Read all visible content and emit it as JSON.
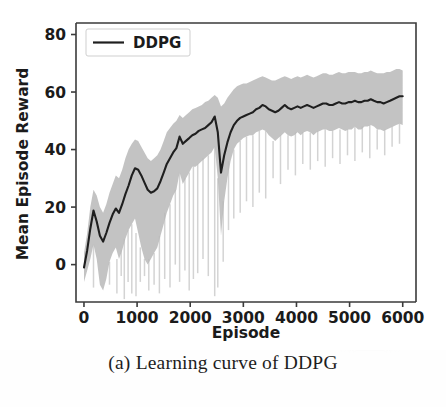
{
  "figure": {
    "caption": "(a) Learning curve of DDPG"
  },
  "chart_data": {
    "type": "line",
    "title": "",
    "subtitle": "",
    "xlabel": "Episode",
    "ylabel": "Mean Episode Reward",
    "xlim": [
      -150,
      6250
    ],
    "ylim": [
      -13,
      84
    ],
    "xticks": [
      0,
      1000,
      2000,
      3000,
      4000,
      5000,
      6000
    ],
    "xtick_labels": [
      "0",
      "1000",
      "2000",
      "3000",
      "4000",
      "5000",
      "6000"
    ],
    "yticks": [
      0,
      20,
      40,
      60,
      80
    ],
    "ytick_labels": [
      "0",
      "20",
      "40",
      "60",
      "80"
    ],
    "grid": false,
    "legend": {
      "position": "upper-left",
      "entries": [
        {
          "label": "DDPG",
          "color": "#1f1f1f",
          "style": "solid"
        }
      ]
    },
    "colors": {
      "line": "#1f1f1f",
      "band": "#b9b9b9",
      "axis": "#3b3b3b",
      "background": "#ffffff"
    },
    "series": [
      {
        "name": "DDPG",
        "kind": "mean-with-band",
        "x": [
          0,
          60,
          120,
          180,
          240,
          300,
          360,
          420,
          480,
          540,
          600,
          660,
          720,
          780,
          840,
          900,
          960,
          1020,
          1080,
          1140,
          1200,
          1260,
          1320,
          1380,
          1440,
          1500,
          1560,
          1620,
          1680,
          1740,
          1800,
          1860,
          1920,
          1980,
          2040,
          2100,
          2160,
          2220,
          2280,
          2340,
          2400,
          2460,
          2520,
          2580,
          2640,
          2700,
          2760,
          2820,
          2880,
          2940,
          3000,
          3060,
          3120,
          3180,
          3240,
          3300,
          3360,
          3420,
          3480,
          3540,
          3600,
          3660,
          3720,
          3780,
          3840,
          3900,
          3960,
          4020,
          4080,
          4140,
          4200,
          4260,
          4320,
          4380,
          4440,
          4500,
          4560,
          4620,
          4680,
          4740,
          4800,
          4860,
          4920,
          4980,
          5040,
          5100,
          5160,
          5220,
          5280,
          5340,
          5400,
          5460,
          5520,
          5580,
          5640,
          5700,
          5760,
          5820,
          5880,
          5940,
          6000
        ],
        "mean": [
          -1.0,
          5.0,
          12.5,
          18.8,
          15.0,
          10.0,
          8.0,
          11.0,
          14.5,
          17.5,
          19.5,
          18.0,
          21.0,
          24.5,
          27.5,
          31.0,
          33.5,
          33.0,
          31.0,
          28.5,
          26.0,
          25.0,
          25.5,
          26.5,
          29.0,
          32.0,
          35.0,
          37.0,
          39.0,
          40.5,
          44.5,
          42.0,
          43.0,
          44.0,
          45.0,
          45.5,
          46.5,
          47.0,
          47.5,
          48.5,
          49.5,
          51.5,
          46.0,
          32.0,
          38.0,
          42.5,
          46.0,
          48.5,
          50.0,
          51.0,
          51.5,
          52.0,
          52.5,
          53.0,
          54.0,
          54.5,
          55.5,
          55.0,
          54.0,
          53.5,
          53.0,
          53.5,
          54.5,
          55.5,
          54.5,
          54.0,
          54.5,
          55.0,
          54.5,
          55.0,
          55.5,
          55.0,
          54.5,
          55.0,
          55.5,
          56.0,
          56.0,
          55.5,
          55.5,
          56.0,
          56.5,
          56.0,
          56.0,
          56.5,
          56.5,
          57.0,
          56.5,
          56.5,
          57.0,
          57.0,
          57.5,
          57.0,
          56.5,
          56.5,
          56.0,
          56.5,
          57.0,
          57.5,
          58.0,
          58.5,
          58.5
        ],
        "band_upper": [
          4.0,
          11.0,
          20.0,
          26.0,
          24.0,
          20.0,
          18.0,
          21.0,
          25.0,
          28.0,
          31.0,
          30.0,
          33.0,
          37.0,
          40.0,
          42.0,
          43.5,
          43.0,
          41.0,
          39.0,
          37.0,
          36.0,
          37.0,
          38.0,
          40.0,
          43.0,
          46.0,
          47.5,
          49.0,
          50.0,
          52.0,
          51.0,
          52.0,
          53.0,
          54.0,
          54.5,
          55.0,
          55.5,
          56.5,
          57.0,
          58.0,
          59.0,
          58.0,
          55.0,
          56.0,
          58.0,
          59.5,
          61.0,
          62.0,
          62.5,
          63.0,
          63.0,
          63.5,
          64.0,
          64.5,
          65.0,
          65.5,
          65.0,
          64.5,
          64.0,
          64.0,
          64.5,
          65.0,
          65.5,
          65.0,
          64.5,
          65.0,
          65.5,
          65.0,
          65.5,
          66.0,
          65.5,
          65.0,
          65.5,
          66.0,
          66.5,
          66.5,
          66.0,
          66.0,
          66.5,
          67.0,
          66.5,
          66.5,
          67.0,
          67.0,
          67.0,
          66.5,
          66.5,
          67.0,
          67.0,
          67.5,
          67.0,
          66.5,
          66.5,
          66.5,
          67.0,
          67.0,
          67.5,
          68.0,
          68.0,
          67.5
        ],
        "band_lower": [
          -6.0,
          -2.0,
          2.0,
          7.0,
          2.0,
          -7.0,
          -9.0,
          -5.0,
          1.0,
          4.0,
          6.0,
          2.0,
          5.0,
          9.0,
          12.0,
          14.0,
          16.0,
          11.0,
          6.0,
          2.0,
          0.0,
          2.0,
          4.0,
          6.0,
          10.0,
          14.0,
          18.0,
          21.0,
          24.0,
          26.0,
          32.0,
          28.0,
          30.0,
          32.0,
          34.0,
          34.0,
          35.0,
          36.0,
          37.0,
          38.0,
          39.0,
          41.0,
          30.0,
          10.0,
          22.0,
          30.0,
          36.0,
          40.0,
          42.0,
          43.0,
          44.0,
          44.5,
          45.0,
          45.0,
          46.0,
          46.5,
          47.0,
          46.5,
          45.0,
          44.0,
          43.0,
          44.0,
          45.0,
          46.0,
          45.0,
          44.5,
          45.0,
          46.0,
          45.0,
          46.0,
          46.5,
          46.0,
          45.0,
          46.0,
          46.5,
          47.0,
          47.0,
          46.5,
          46.5,
          47.0,
          47.5,
          47.0,
          46.5,
          47.0,
          47.0,
          48.0,
          47.0,
          47.0,
          48.0,
          48.0,
          48.5,
          48.0,
          47.0,
          47.0,
          46.5,
          47.0,
          47.5,
          48.0,
          48.5,
          49.0,
          48.5
        ],
        "spikes": [
          {
            "x": 180,
            "depth": -8
          },
          {
            "x": 320,
            "depth": -9
          },
          {
            "x": 480,
            "depth": -7
          },
          {
            "x": 620,
            "depth": -10
          },
          {
            "x": 700,
            "depth": -4
          },
          {
            "x": 760,
            "depth": -12
          },
          {
            "x": 830,
            "depth": -6
          },
          {
            "x": 900,
            "depth": -10
          },
          {
            "x": 980,
            "depth": -11
          },
          {
            "x": 1060,
            "depth": -6
          },
          {
            "x": 1140,
            "depth": -4
          },
          {
            "x": 1220,
            "depth": -9
          },
          {
            "x": 1320,
            "depth": -7
          },
          {
            "x": 1420,
            "depth": -10
          },
          {
            "x": 1520,
            "depth": -5
          },
          {
            "x": 1620,
            "depth": -8
          },
          {
            "x": 1720,
            "depth": 0
          },
          {
            "x": 1800,
            "depth": -6
          },
          {
            "x": 1900,
            "depth": -2
          },
          {
            "x": 1980,
            "depth": -9
          },
          {
            "x": 2060,
            "depth": -5
          },
          {
            "x": 2140,
            "depth": -3
          },
          {
            "x": 2240,
            "depth": 2
          },
          {
            "x": 2340,
            "depth": -4
          },
          {
            "x": 2460,
            "depth": -11
          },
          {
            "x": 2520,
            "depth": -8
          },
          {
            "x": 2620,
            "depth": 1
          },
          {
            "x": 2720,
            "depth": 12
          },
          {
            "x": 2820,
            "depth": 16
          },
          {
            "x": 2940,
            "depth": 18
          },
          {
            "x": 3060,
            "depth": 22
          },
          {
            "x": 3180,
            "depth": 20
          },
          {
            "x": 3300,
            "depth": 25
          },
          {
            "x": 3420,
            "depth": 23
          },
          {
            "x": 3560,
            "depth": 30
          },
          {
            "x": 3700,
            "depth": 28
          },
          {
            "x": 3840,
            "depth": 33
          },
          {
            "x": 3980,
            "depth": 31
          },
          {
            "x": 4120,
            "depth": 35
          },
          {
            "x": 4260,
            "depth": 33
          },
          {
            "x": 4400,
            "depth": 36
          },
          {
            "x": 4540,
            "depth": 34
          },
          {
            "x": 4680,
            "depth": 37
          },
          {
            "x": 4820,
            "depth": 35
          },
          {
            "x": 4960,
            "depth": 38
          },
          {
            "x": 5100,
            "depth": 36
          },
          {
            "x": 5240,
            "depth": 39
          },
          {
            "x": 5380,
            "depth": 37
          },
          {
            "x": 5520,
            "depth": 40
          },
          {
            "x": 5660,
            "depth": 38
          },
          {
            "x": 5800,
            "depth": 41
          },
          {
            "x": 5940,
            "depth": 42
          }
        ]
      }
    ]
  }
}
